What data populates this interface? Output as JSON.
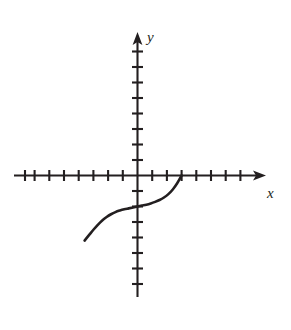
{
  "figure": {
    "kind": "cartesian-coordinate-plane-with-curve",
    "background_color": "#ffffff",
    "ink_color": "#231f20",
    "width": 291,
    "height": 330
  },
  "axes": {
    "x": {
      "label": "x",
      "label_style": "italic",
      "arrow": "right",
      "range_px": [
        14,
        266
      ],
      "origin_px": 137.5,
      "tick_spacing_px": 14.7,
      "tick_count_negative": 8,
      "tick_count_positive": 8,
      "tick_length_px": 11,
      "axis_y_px": 175.5,
      "tick_values_negative": [
        -8,
        -7,
        -6,
        -5,
        -4,
        -3,
        -2,
        -1
      ],
      "tick_values_positive": [
        1,
        2,
        3,
        4,
        5,
        6,
        7,
        8
      ]
    },
    "y": {
      "label": "y",
      "label_style": "italic",
      "arrow": "up",
      "range_px": [
        32,
        297
      ],
      "origin_px": 175.5,
      "tick_spacing_px": 15.5,
      "tick_count_positive": 7,
      "tick_count_negative": 7,
      "tick_length_px": 11,
      "axis_x_px": 137.5,
      "tick_values_positive": [
        1,
        2,
        3,
        4,
        5,
        6,
        7
      ],
      "tick_values_negative": [
        -1,
        -2,
        -3,
        -4,
        -5,
        -6,
        -7
      ]
    }
  },
  "chart_data": {
    "type": "line",
    "title": "",
    "xlabel": "x",
    "ylabel": "y",
    "grid": false,
    "legend": null,
    "xlim": [
      -8.4,
      8.7
    ],
    "ylim": [
      -9.3,
      9.3
    ],
    "series": [
      {
        "name": "curve",
        "stroke": "#231f20",
        "stroke_width_px": 2.6,
        "x": [
          -3.6,
          -3.3,
          -3.0,
          -2.7,
          -2.4,
          -2.1,
          -1.8,
          -1.5,
          -1.2,
          -0.9,
          -0.6,
          -0.3,
          0.0,
          0.3,
          0.6,
          0.9,
          1.2,
          1.5,
          1.8,
          2.1,
          2.4,
          2.7,
          3.0
        ],
        "y": [
          -4.2,
          -3.85,
          -3.5,
          -3.18,
          -2.9,
          -2.68,
          -2.5,
          -2.36,
          -2.26,
          -2.18,
          -2.12,
          -2.06,
          -2.0,
          -1.94,
          -1.88,
          -1.8,
          -1.7,
          -1.58,
          -1.42,
          -1.2,
          -0.9,
          -0.5,
          0.0
        ],
        "endpoints_px": {
          "left": [
            85.5,
            240.0
          ],
          "inflection": [
            137.5,
            206.5
          ],
          "right": [
            182.5,
            175.5
          ]
        }
      }
    ]
  }
}
